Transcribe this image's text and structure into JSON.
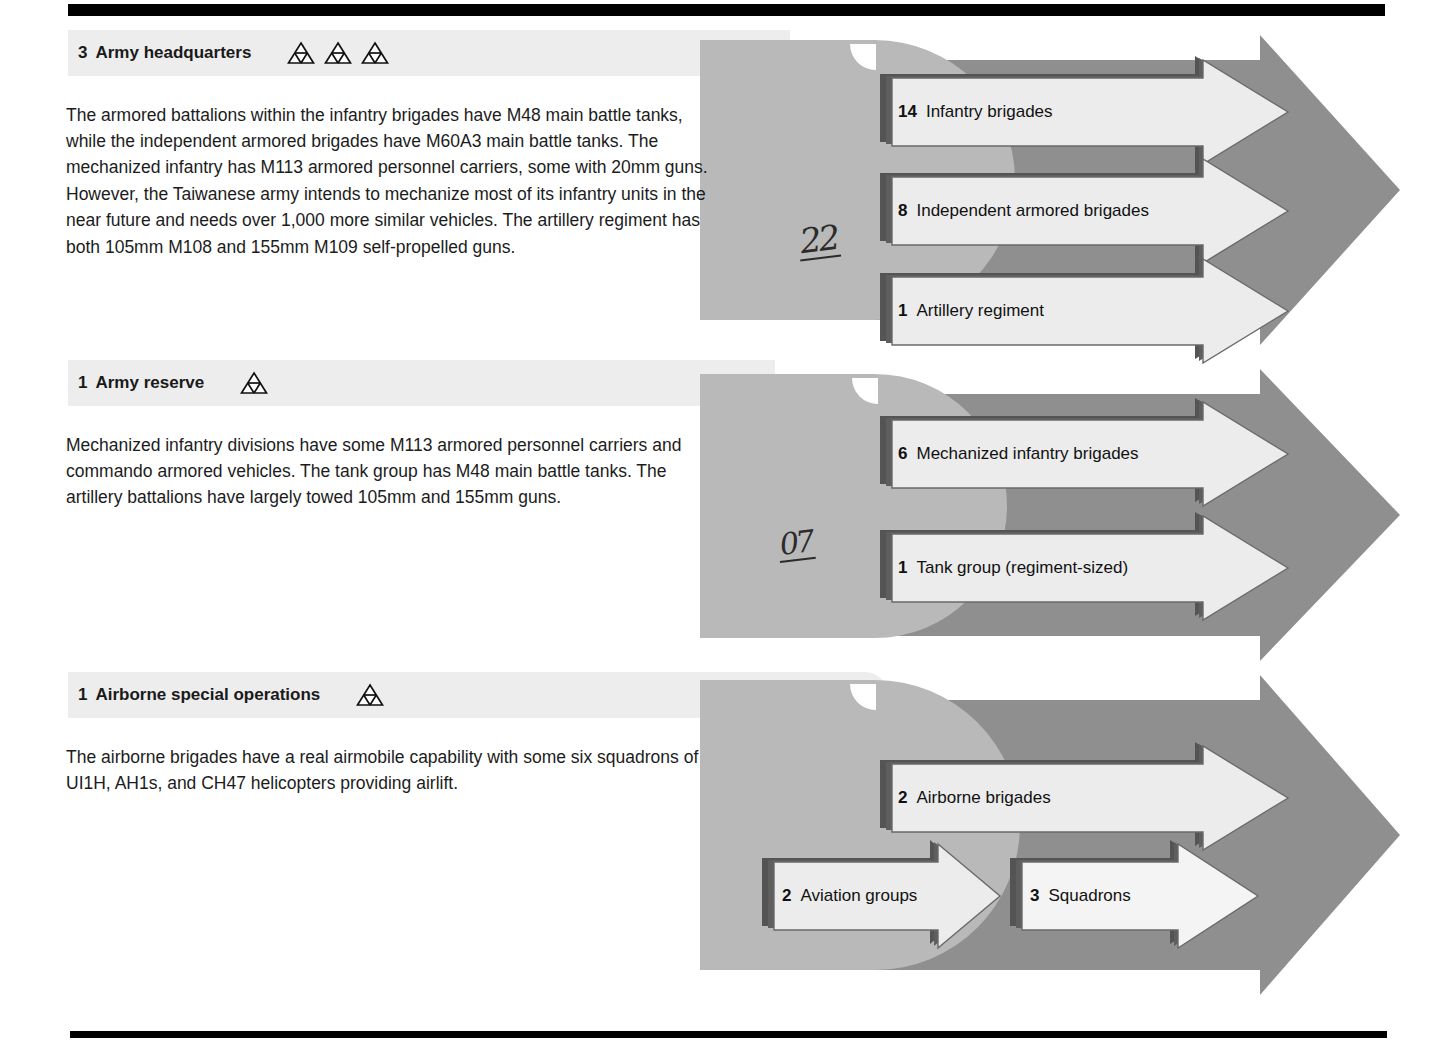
{
  "document": {
    "title": "Taiwanese army order of battle",
    "rule_color": "#000000",
    "palette": {
      "header_band": "#ededed",
      "blob_gray": "#b9b9b9",
      "big_arrow_gray": "#8f8f8f",
      "callout_fill": "#ececec",
      "callout_shadow": "#545454",
      "text": "#1a1a1a"
    }
  },
  "sections": [
    {
      "id": "army-headquarters",
      "count": "3",
      "title": "Army headquarters",
      "symbol_count": 3,
      "symbol_name": "armored-unit-symbol",
      "body": "The armored battalions within the infantry brigades have M48 main battle tanks, while the independent armored brigades have M60A3 main battle tanks. The mechanized infantry has M113 armored personnel carriers, some with 20mm guns. However, the Taiwanese army intends to mechanize most of its infantry units in the near future and needs over 1,000 more similar vehicles. The artillery regiment has both 105mm M108 and 155mm M109 self-propelled guns.",
      "handwriting": "22",
      "callouts": [
        {
          "count": "14",
          "label": "Infantry brigades"
        },
        {
          "count": "8",
          "label": "Independent armored brigades"
        },
        {
          "count": "1",
          "label": "Artillery regiment"
        }
      ]
    },
    {
      "id": "army-reserve",
      "count": "1",
      "title": "Army reserve",
      "symbol_count": 1,
      "symbol_name": "armored-unit-symbol",
      "body": "Mechanized infantry divisions have some M113 armored personnel carriers and commando armored vehicles. The tank group has M48 main battle tanks. The artillery battalions have largely towed 105mm and 155mm guns.",
      "handwriting": "07",
      "callouts": [
        {
          "count": "6",
          "label": "Mechanized infantry brigades"
        },
        {
          "count": "1",
          "label": "Tank group (regiment-sized)"
        }
      ]
    },
    {
      "id": "airborne-special-operations",
      "count": "1",
      "title": "Airborne special operations",
      "symbol_count": 1,
      "symbol_name": "armored-unit-symbol",
      "body": "The airborne brigades have a real airmobile capability with some six squadrons of UI1H, AH1s, and CH47 helicopters providing airlift.",
      "handwriting": "",
      "callouts": [
        {
          "count": "2",
          "label": "Airborne brigades"
        },
        {
          "count": "2",
          "label": "Aviation groups"
        },
        {
          "count": "3",
          "label": "Squadrons"
        }
      ]
    }
  ]
}
